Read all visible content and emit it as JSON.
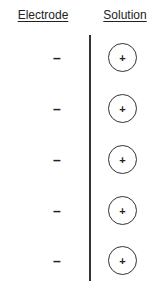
{
  "headers": {
    "electrode": "Electrode",
    "solution": "Solution"
  },
  "electrode_charges": [
    {
      "symbol": "–",
      "y": 52
    },
    {
      "symbol": "–",
      "y": 103
    },
    {
      "symbol": "–",
      "y": 154
    },
    {
      "symbol": "–",
      "y": 205
    },
    {
      "symbol": "–",
      "y": 255
    }
  ],
  "solution_ions": [
    {
      "symbol": "+",
      "y": 43
    },
    {
      "symbol": "+",
      "y": 94
    },
    {
      "symbol": "+",
      "y": 145
    },
    {
      "symbol": "+",
      "y": 196
    },
    {
      "symbol": "+",
      "y": 246
    }
  ]
}
